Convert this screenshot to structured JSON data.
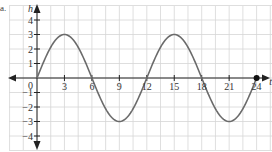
{
  "problem_label": "a.",
  "chart_data": {
    "type": "line",
    "title": "",
    "xlabel": "t",
    "ylabel": "h",
    "function": "h = 3 sin(pi t / 6)",
    "x_ticks": [
      0,
      3,
      6,
      9,
      12,
      15,
      18,
      21,
      24
    ],
    "y_ticks": [
      -4,
      -3,
      -2,
      -1,
      1,
      2,
      3,
      4
    ],
    "xlim": [
      -3,
      25
    ],
    "ylim": [
      -5,
      4.8
    ],
    "grid": true,
    "legend": null,
    "series": [
      {
        "name": "h(t)",
        "x": [
          0,
          1.5,
          3,
          4.5,
          6,
          7.5,
          9,
          10.5,
          12,
          13.5,
          15,
          16.5,
          18,
          19.5,
          21,
          22.5,
          24
        ],
        "values": [
          0,
          2.12,
          3,
          2.12,
          0,
          -2.12,
          -3,
          -2.12,
          0,
          2.12,
          3,
          2.12,
          0,
          -2.12,
          -3,
          -2.12,
          0
        ]
      }
    ],
    "annotations": [
      {
        "type": "endpoint-dot",
        "x": 24,
        "y": 0
      },
      {
        "type": "origin-label",
        "text": "0"
      }
    ]
  },
  "colors": {
    "curve": "#6b6b6b",
    "axis": "#222222",
    "grid": "#d6d6d6",
    "dot": "#111111"
  }
}
